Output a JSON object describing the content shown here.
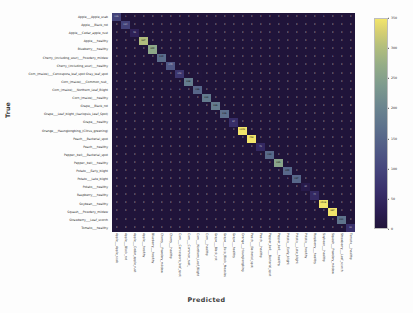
{
  "figure": {
    "xlabel": "Predicted",
    "ylabel": "True",
    "colormap": "viridis-dark",
    "background": "#fdfdfd"
  },
  "chart_data": {
    "type": "heatmap",
    "title": "",
    "xlabel": "Predicted",
    "ylabel": "True",
    "grid": false,
    "legend_position": "right",
    "colorbar": {
      "min": 0,
      "max": 350,
      "ticks": [
        0,
        50,
        100,
        150,
        200,
        250,
        300,
        350
      ],
      "tick_labels": [
        "0",
        "50",
        "100",
        "150",
        "200",
        "250",
        "300",
        "350"
      ]
    },
    "categories": [
      "Apple___Apple_scab",
      "Apple___Black_rot",
      "Apple___Cedar_apple_rust",
      "Apple___healthy",
      "Blueberry___healthy",
      "Cherry_(including_sour)___Powdery_mildew",
      "Cherry_(including_sour)___healthy",
      "Corn_(maize)___Cercospora_leaf_spot Gray_leaf_spot",
      "Corn_(maize)___Common_rust_",
      "Corn_(maize)___Northern_Leaf_Blight",
      "Corn_(maize)___healthy",
      "Grape___Black_rot",
      "Grape___Esca_(Black_Measles)",
      "Grape___healthy",
      "Orange___Haunglongbing_(Citrus_greening)",
      "Peach___Bacterial_spot",
      "Peach___healthy",
      "Pepper,_bell___Bacterial_spot",
      "Pepper,_bell___healthy",
      "Potato___Early_blight",
      "Potato___Late_blight",
      "Potato___healthy",
      "Raspberry___healthy",
      "Soybean___healthy",
      "Squash___Powdery_mildew",
      "Strawberry___Leaf_scorch",
      "Strawberry___healthy",
      "Tomato___Bacterial_spot",
      "Tomato___Early_blight",
      "Tomato___Late_blight",
      "Tomato___Leaf_Mold",
      "Tomato___Septoria_leaf_spot"
    ],
    "y_categories": [
      "Apple___Apple_scab",
      "Apple___Black_rot",
      "Apple___Cedar_apple_rust",
      "Apple___healthy",
      "Blueberry___healthy",
      "Cherry_(including_sour)___Powdery_mildew",
      "Cherry_(including_sour)___healthy",
      "Corn_(maize)___Cercospora_leaf_spot Gray_leaf_spot",
      "Corn_(maize)___Common_rust_",
      "Corn_(maize)___Northern_Leaf_Blight",
      "Corn_(maize)___healthy",
      "Grape___Black_rot",
      "Grape___Leaf_blight_(Isariopsis_Leaf_Spot)",
      "Grape___healthy",
      "Orange___Haunglongbing_(Citrus_greening)",
      "Peach___Bacterial_spot",
      "Peach___healthy",
      "Pepper,_bell___Bacterial_spot",
      "Pepper,_bell___healthy",
      "Potato___Early_blight",
      "Potato___Late_blight",
      "Potato___healthy",
      "Raspberry___healthy",
      "Soybean___healthy",
      "Squash___Powdery_mildew",
      "Strawberry___Bacterial_spot",
      "Strawberry___Leaf_scorch",
      "Tomato___healthy"
    ],
    "x_tick_labels": [
      "Apple___Apple_scab",
      "Apple___Black_rot",
      "Apple___Cedar_apple_rust",
      "Apple___healthy",
      "Blueberry___healthy",
      "Cherry___Powdery_mildew",
      "Cherry___healthy",
      "Corn___Cercospora_leaf_spot",
      "Corn___Common_rust_",
      "Corn___Northern_Leaf_Blight",
      "Corn___healthy",
      "Grape___Black_rot",
      "Grape___Esca_Black_Measles",
      "Grape___healthy",
      "Orange___Haunglongbing",
      "Peach___Bacterial_spot",
      "Peach___healthy",
      "Pepper_bell___Bacterial_spot",
      "Pepper_bell___healthy",
      "Potato___Early_blight",
      "Potato___Late_blight",
      "Potato___healthy",
      "Raspberry___healthy",
      "Soybean___healthy",
      "Squash___Powdery_mildew",
      "Strawberry___Leaf_scorch",
      "Tomato___healthy"
    ],
    "y_tick_labels": [
      "Apple___Apple_scab",
      "Apple___Black_rot",
      "Apple___Cedar_apple_rust",
      "Apple___healthy",
      "Blueberry___healthy",
      "Cherry_(including_sour)___Powdery_mildew",
      "Cherry_(including_sour)___healthy",
      "Corn_(maize)___Cercospora_leaf_spot Gray_leaf_spot",
      "Corn_(maize)___Common_rust_",
      "Corn_(maize)___Northern_Leaf_Blight",
      "Corn_(maize)___healthy",
      "Grape___Black_rot",
      "Grape___Leaf_blight_(Isariopsis_Leaf_Spot)",
      "Grape___healthy",
      "Orange___Haunglongbing_(Citrus_greening)",
      "Peach___Bacterial_spot",
      "Peach___healthy",
      "Pepper,_bell___Bacterial_spot",
      "Pepper,_bell___healthy",
      "Potato___Early_blight",
      "Potato___Late_blight",
      "Potato___healthy",
      "Raspberry___healthy",
      "Soybean___healthy",
      "Squash___Powdery_mildew",
      "Strawberry___Leaf_scorch",
      "Tomato___healthy"
    ],
    "matrix": [
      [
        126,
        1,
        0,
        0,
        0,
        0,
        0,
        0,
        0,
        0,
        0,
        0,
        0,
        0,
        0,
        0,
        0,
        0,
        0,
        0,
        0,
        0,
        0,
        1,
        0,
        0,
        0
      ],
      [
        0,
        124,
        0,
        0,
        0,
        0,
        0,
        0,
        0,
        0,
        0,
        0,
        0,
        0,
        0,
        0,
        0,
        0,
        0,
        0,
        0,
        0,
        0,
        0,
        0,
        0,
        0
      ],
      [
        0,
        0,
        55,
        0,
        0,
        0,
        0,
        0,
        0,
        0,
        0,
        0,
        0,
        0,
        0,
        0,
        0,
        0,
        0,
        0,
        0,
        0,
        0,
        0,
        0,
        0,
        0
      ],
      [
        0,
        0,
        0,
        327,
        0,
        0,
        0,
        0,
        0,
        0,
        0,
        0,
        0,
        0,
        0,
        1,
        0,
        0,
        0,
        0,
        0,
        0,
        0,
        0,
        0,
        0,
        0
      ],
      [
        0,
        0,
        0,
        0,
        300,
        0,
        0,
        0,
        0,
        0,
        0,
        0,
        0,
        0,
        0,
        0,
        0,
        0,
        0,
        0,
        0,
        0,
        0,
        1,
        0,
        0,
        0
      ],
      [
        0,
        0,
        0,
        0,
        0,
        210,
        0,
        0,
        0,
        0,
        0,
        0,
        0,
        0,
        0,
        0,
        0,
        0,
        0,
        0,
        0,
        0,
        0,
        0,
        1,
        0,
        0
      ],
      [
        0,
        0,
        0,
        0,
        0,
        0,
        170,
        0,
        0,
        0,
        0,
        0,
        0,
        0,
        0,
        0,
        0,
        0,
        0,
        0,
        0,
        0,
        0,
        0,
        0,
        0,
        0
      ],
      [
        0,
        0,
        0,
        0,
        0,
        0,
        0,
        102,
        0,
        3,
        0,
        0,
        0,
        0,
        0,
        0,
        0,
        0,
        0,
        0,
        0,
        0,
        0,
        0,
        0,
        0,
        0
      ],
      [
        0,
        0,
        0,
        0,
        0,
        0,
        0,
        0,
        238,
        0,
        0,
        0,
        0,
        0,
        0,
        0,
        0,
        0,
        0,
        0,
        0,
        0,
        0,
        0,
        0,
        0,
        0
      ],
      [
        0,
        0,
        0,
        0,
        0,
        0,
        1,
        2,
        0,
        196,
        0,
        0,
        0,
        0,
        0,
        0,
        0,
        0,
        0,
        0,
        0,
        0,
        0,
        0,
        0,
        0,
        0
      ],
      [
        0,
        0,
        0,
        0,
        0,
        0,
        0,
        0,
        0,
        0,
        232,
        0,
        0,
        0,
        0,
        0,
        0,
        0,
        0,
        0,
        0,
        0,
        0,
        0,
        0,
        0,
        0
      ],
      [
        0,
        0,
        0,
        0,
        0,
        0,
        0,
        0,
        0,
        0,
        0,
        236,
        0,
        0,
        0,
        0,
        0,
        0,
        0,
        0,
        0,
        0,
        0,
        0,
        0,
        0,
        0
      ],
      [
        0,
        0,
        0,
        0,
        0,
        0,
        0,
        0,
        0,
        0,
        0,
        0,
        216,
        0,
        0,
        0,
        0,
        0,
        0,
        0,
        0,
        0,
        0,
        0,
        0,
        0,
        0
      ],
      [
        0,
        0,
        0,
        0,
        0,
        0,
        0,
        0,
        0,
        0,
        0,
        0,
        0,
        84,
        0,
        0,
        0,
        0,
        0,
        0,
        0,
        0,
        0,
        0,
        0,
        0,
        0
      ],
      [
        0,
        0,
        0,
        0,
        0,
        0,
        0,
        0,
        0,
        0,
        0,
        0,
        0,
        0,
        1102,
        0,
        0,
        0,
        0,
        0,
        0,
        0,
        0,
        0,
        0,
        0,
        0
      ],
      [
        0,
        0,
        0,
        0,
        0,
        0,
        0,
        0,
        0,
        0,
        0,
        0,
        0,
        0,
        0,
        459,
        0,
        0,
        0,
        0,
        0,
        0,
        0,
        0,
        0,
        0,
        0
      ],
      [
        0,
        0,
        0,
        0,
        0,
        0,
        0,
        0,
        0,
        0,
        0,
        0,
        0,
        0,
        0,
        0,
        72,
        0,
        0,
        0,
        0,
        0,
        0,
        0,
        0,
        0,
        0
      ],
      [
        0,
        0,
        0,
        0,
        0,
        0,
        0,
        0,
        0,
        0,
        0,
        0,
        0,
        0,
        0,
        0,
        0,
        199,
        0,
        0,
        0,
        0,
        0,
        0,
        0,
        0,
        0
      ],
      [
        0,
        0,
        0,
        0,
        0,
        0,
        0,
        0,
        0,
        0,
        0,
        0,
        0,
        0,
        0,
        0,
        0,
        0,
        295,
        0,
        0,
        0,
        0,
        0,
        0,
        0,
        0
      ],
      [
        0,
        0,
        0,
        0,
        0,
        0,
        0,
        0,
        0,
        0,
        0,
        0,
        0,
        0,
        0,
        0,
        0,
        0,
        0,
        200,
        0,
        0,
        0,
        0,
        0,
        0,
        0
      ],
      [
        0,
        0,
        0,
        0,
        0,
        0,
        0,
        0,
        0,
        0,
        0,
        0,
        0,
        0,
        0,
        0,
        0,
        0,
        0,
        1,
        197,
        0,
        0,
        0,
        0,
        0,
        0
      ],
      [
        0,
        0,
        0,
        0,
        0,
        0,
        0,
        0,
        0,
        0,
        0,
        0,
        0,
        0,
        0,
        0,
        0,
        0,
        0,
        0,
        0,
        30,
        0,
        0,
        0,
        0,
        0
      ],
      [
        0,
        0,
        0,
        0,
        0,
        0,
        0,
        0,
        0,
        0,
        0,
        0,
        0,
        0,
        0,
        0,
        0,
        0,
        0,
        0,
        0,
        0,
        74,
        0,
        0,
        0,
        0
      ],
      [
        0,
        0,
        0,
        0,
        0,
        0,
        0,
        0,
        0,
        0,
        0,
        0,
        0,
        0,
        0,
        0,
        0,
        0,
        0,
        0,
        0,
        0,
        0,
        1018,
        0,
        0,
        0
      ],
      [
        0,
        0,
        0,
        0,
        0,
        0,
        0,
        0,
        0,
        0,
        0,
        0,
        0,
        0,
        0,
        0,
        0,
        0,
        0,
        0,
        0,
        0,
        0,
        0,
        367,
        0,
        0
      ],
      [
        0,
        0,
        0,
        0,
        0,
        0,
        0,
        0,
        0,
        0,
        0,
        0,
        0,
        0,
        0,
        0,
        0,
        0,
        0,
        0,
        0,
        0,
        0,
        0,
        0,
        221,
        0
      ],
      [
        0,
        0,
        0,
        0,
        0,
        0,
        0,
        0,
        0,
        0,
        0,
        0,
        0,
        0,
        0,
        0,
        0,
        0,
        0,
        0,
        0,
        0,
        0,
        0,
        0,
        0,
        91
      ]
    ]
  }
}
